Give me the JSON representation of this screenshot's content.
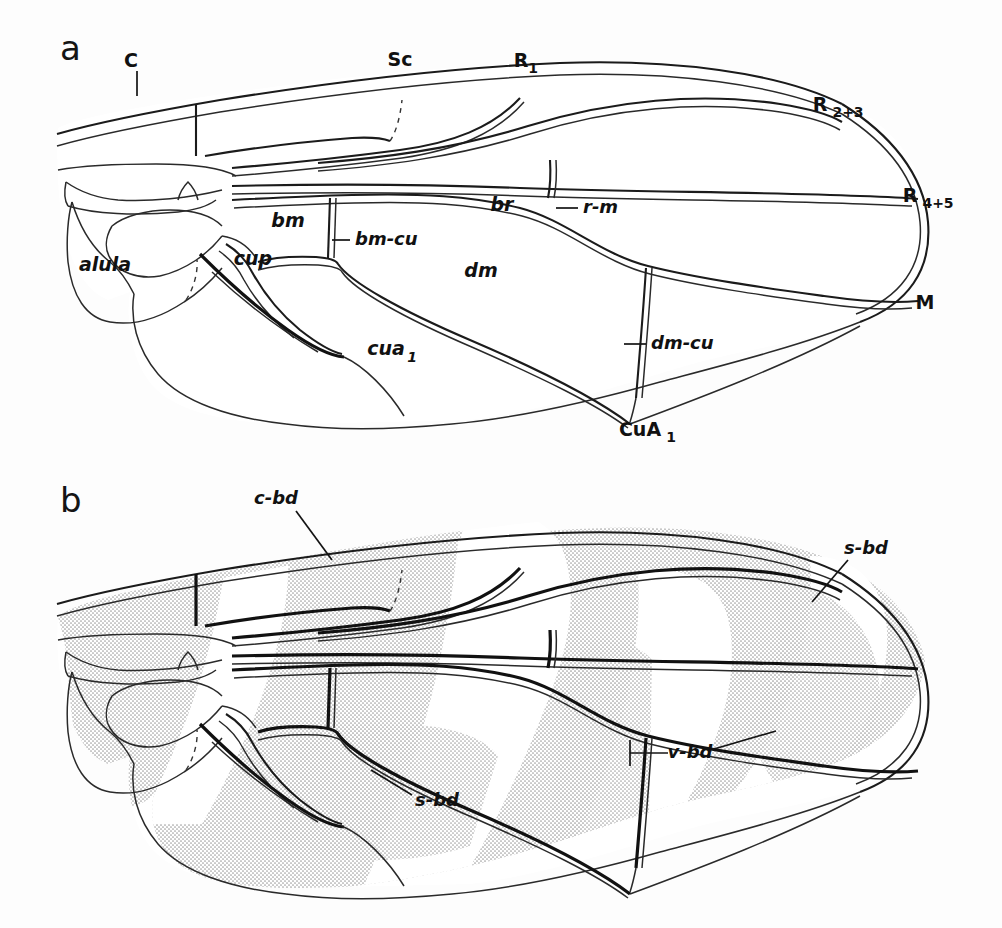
{
  "figure": {
    "kind": "scientific-illustration",
    "background_color": "#fdfdfd",
    "ink_color": "#111111",
    "shade_color": "#d8d8d8"
  },
  "panels": [
    {
      "id": "a",
      "letter": "a",
      "caption": "wing venation with named veins and cells",
      "labels": [
        {
          "name": "costa",
          "text": "C",
          "sub": "",
          "style": "upright",
          "x": 131,
          "y": 61,
          "leader": [
            [
              137,
              71
            ],
            [
              137,
              96
            ]
          ]
        },
        {
          "name": "subcosta",
          "text": "Sc",
          "sub": "",
          "style": "upright",
          "x": 400,
          "y": 60,
          "leader": []
        },
        {
          "name": "radius-1",
          "text": "R",
          "sub": "1",
          "style": "upright",
          "x": 527,
          "y": 61,
          "leader": []
        },
        {
          "name": "radius-2-3",
          "text": "R",
          "sub": "2+3",
          "style": "upright",
          "x": 832,
          "y": 107,
          "leader": []
        },
        {
          "name": "radius-4-5",
          "text": "R",
          "sub": "4+5",
          "style": "upright",
          "x": 922,
          "y": 198,
          "leader": []
        },
        {
          "name": "media",
          "text": "M",
          "sub": "",
          "style": "upright",
          "x": 925,
          "y": 303,
          "leader": []
        },
        {
          "name": "cubitus-anterior-1",
          "text": "CuA",
          "sub": "1",
          "style": "upright",
          "x": 646,
          "y": 430,
          "leader": []
        },
        {
          "name": "cell-alula",
          "text": "alula",
          "sub": "",
          "style": "italic",
          "x": 105,
          "y": 265,
          "leader": []
        },
        {
          "name": "cell-cup",
          "text": "cup",
          "sub": "",
          "style": "italic",
          "x": 253,
          "y": 259,
          "leader": []
        },
        {
          "name": "cell-bm",
          "text": "bm",
          "sub": "",
          "style": "italic",
          "x": 288,
          "y": 221,
          "leader": []
        },
        {
          "name": "crossvein-bm-cu",
          "text": "bm-cu",
          "sub": "",
          "style": "italic",
          "x": 362,
          "y": 240,
          "leader": [
            [
              330,
              240
            ],
            [
              348,
              240
            ]
          ]
        },
        {
          "name": "cell-br",
          "text": "br",
          "sub": "",
          "style": "italic",
          "x": 502,
          "y": 205,
          "leader": []
        },
        {
          "name": "crossvein-r-m",
          "text": "r-m",
          "sub": "",
          "style": "italic",
          "x": 593,
          "y": 208,
          "leader": [
            [
              554,
              208
            ],
            [
              578,
              208
            ]
          ]
        },
        {
          "name": "cell-dm",
          "text": "dm",
          "sub": "",
          "style": "italic",
          "x": 481,
          "y": 271,
          "leader": []
        },
        {
          "name": "cell-cua1",
          "text": "cua",
          "sub": "1",
          "style": "italic",
          "x": 393,
          "y": 349,
          "leader": []
        },
        {
          "name": "crossvein-dm-cu",
          "text": "dm-cu",
          "sub": "",
          "style": "italic",
          "x": 660,
          "y": 344,
          "leader": [
            [
              620,
              344
            ],
            [
              645,
              344
            ]
          ]
        }
      ]
    },
    {
      "id": "b",
      "letter": "b",
      "caption": "wing with pigment bands indicated by stippling",
      "labels": [
        {
          "name": "costal-band",
          "text": "c-bd",
          "sub": "",
          "style": "italic",
          "x": 279,
          "y": 499,
          "leader": [
            [
              296,
              511
            ],
            [
              330,
              558
            ]
          ]
        },
        {
          "name": "subapical-band",
          "text": "s-bd",
          "sub": "",
          "style": "italic",
          "x": 864,
          "y": 549,
          "leader": [
            [
              849,
              559
            ],
            [
              812,
              601
            ]
          ]
        },
        {
          "name": "vertical-band",
          "text": "v-bd",
          "sub": "",
          "style": "italic",
          "x": 688,
          "y": 753,
          "leader": [
            [
              630,
              753
            ],
            [
              668,
              753
            ]
          ],
          "leader2": [
            [
              712,
              750
            ],
            [
              770,
              735
            ]
          ]
        },
        {
          "name": "submedial-band",
          "text": "s-bd",
          "sub": "",
          "style": "italic",
          "x": 437,
          "y": 800,
          "leader": [
            [
              410,
              797
            ],
            [
              370,
              771
            ]
          ]
        }
      ]
    }
  ]
}
